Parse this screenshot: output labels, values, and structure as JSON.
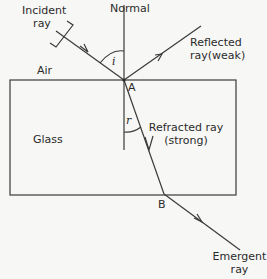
{
  "diagram": {
    "labels": {
      "normal": "Normal",
      "incident_line1": "Incident",
      "incident_line2": "ray",
      "reflected_line1": "Reflected",
      "reflected_line2": "ray(weak)",
      "air": "Air",
      "glass": "Glass",
      "point_a": "A",
      "point_b": "B",
      "angle_i": "i",
      "angle_r": "r",
      "refracted_line1": "Refracted ray",
      "refracted_line2": "(strong)",
      "emergent_line1": "Emergent",
      "emergent_line2": "ray"
    },
    "colors": {
      "line": "#3a3a3a",
      "background": "#f7f7f5"
    }
  }
}
